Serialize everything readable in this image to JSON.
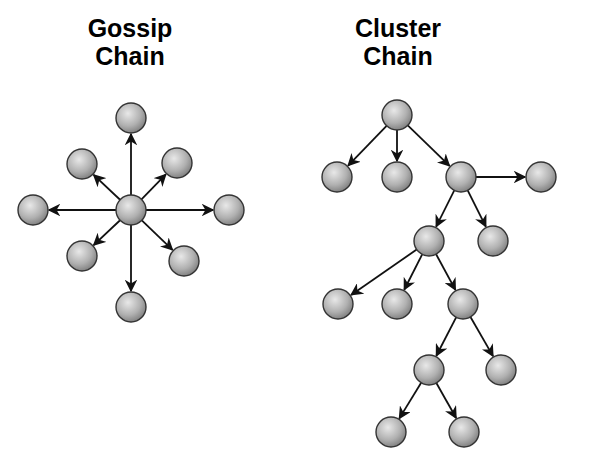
{
  "diagrams": [
    {
      "title_line1": "Gossip",
      "title_line2": "Chain",
      "node_radius": 15,
      "nodes": [
        {
          "id": "center",
          "x": 131,
          "y": 210
        },
        {
          "id": "top",
          "x": 131,
          "y": 118
        },
        {
          "id": "upper-left",
          "x": 82,
          "y": 164
        },
        {
          "id": "upper-right",
          "x": 177,
          "y": 163
        },
        {
          "id": "left",
          "x": 33,
          "y": 210
        },
        {
          "id": "right",
          "x": 229,
          "y": 210
        },
        {
          "id": "lower-left",
          "x": 82,
          "y": 256
        },
        {
          "id": "lower-right",
          "x": 184,
          "y": 261
        },
        {
          "id": "bottom",
          "x": 131,
          "y": 307
        }
      ],
      "edges": [
        [
          "center",
          "top"
        ],
        [
          "center",
          "upper-left"
        ],
        [
          "center",
          "upper-right"
        ],
        [
          "center",
          "left"
        ],
        [
          "center",
          "right"
        ],
        [
          "center",
          "lower-left"
        ],
        [
          "center",
          "lower-right"
        ],
        [
          "center",
          "bottom"
        ]
      ]
    },
    {
      "title_line1": "Cluster",
      "title_line2": "Chain",
      "node_radius": 15,
      "nodes": [
        {
          "id": "root",
          "x": 397,
          "y": 115
        },
        {
          "id": "a1",
          "x": 337,
          "y": 177
        },
        {
          "id": "a2",
          "x": 397,
          "y": 177
        },
        {
          "id": "a3",
          "x": 461,
          "y": 177
        },
        {
          "id": "a4",
          "x": 541,
          "y": 177
        },
        {
          "id": "b1",
          "x": 429,
          "y": 241
        },
        {
          "id": "b2",
          "x": 493,
          "y": 241
        },
        {
          "id": "c1",
          "x": 338,
          "y": 304
        },
        {
          "id": "c2",
          "x": 397,
          "y": 304
        },
        {
          "id": "c3",
          "x": 463,
          "y": 304
        },
        {
          "id": "d1",
          "x": 429,
          "y": 370
        },
        {
          "id": "d2",
          "x": 501,
          "y": 370
        },
        {
          "id": "e1",
          "x": 391,
          "y": 432
        },
        {
          "id": "e2",
          "x": 464,
          "y": 432
        }
      ],
      "edges": [
        [
          "root",
          "a1"
        ],
        [
          "root",
          "a2"
        ],
        [
          "root",
          "a3"
        ],
        [
          "a3",
          "a4"
        ],
        [
          "a3",
          "b1"
        ],
        [
          "a3",
          "b2"
        ],
        [
          "b1",
          "c1"
        ],
        [
          "b1",
          "c2"
        ],
        [
          "b1",
          "c3"
        ],
        [
          "c3",
          "d1"
        ],
        [
          "c3",
          "d2"
        ],
        [
          "d1",
          "e1"
        ],
        [
          "d1",
          "e2"
        ]
      ]
    }
  ],
  "colors": {
    "node_fill_light": "#e4e4e4",
    "node_fill_dark": "#8a8a8a",
    "stroke": "#111111"
  }
}
